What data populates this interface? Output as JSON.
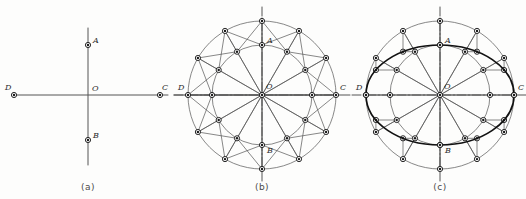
{
  "figure": {
    "background_color": "#fdfdfc",
    "line_color": "#555555",
    "bold_line_color": "#111111",
    "marker_fill": "#1a1a1a",
    "marker_ring": "#ffffff",
    "label_color": "#2b2b2b"
  },
  "panels": [
    {
      "id": "a",
      "caption": "(a)",
      "caption_x": 88,
      "caption_y": 188,
      "description": "Major and minor axes only",
      "center": {
        "x": 88,
        "y": 95,
        "label": "O"
      },
      "points": [
        {
          "label": "A",
          "x": 88,
          "y": 45,
          "label_dx": 5,
          "label_dy": -2
        },
        {
          "label": "B",
          "x": 88,
          "y": 140,
          "label_dx": 5,
          "label_dy": -2
        },
        {
          "label": "C",
          "x": 160,
          "y": 95,
          "label_dx": 2,
          "label_dy": -5
        },
        {
          "label": "D",
          "x": 14,
          "y": 95,
          "label_dx": -9,
          "label_dy": -5
        }
      ],
      "axis_horizontal": {
        "x1": 14,
        "y1": 95,
        "x2": 168,
        "y2": 95
      },
      "axis_vertical": {
        "x1": 88,
        "y1": 28,
        "x2": 88,
        "y2": 165
      }
    },
    {
      "id": "b",
      "caption": "(b)",
      "caption_x": 262,
      "caption_y": 188,
      "description": "Two concentric circles divided by twelve radial lines",
      "center": {
        "x": 262,
        "y": 95,
        "label": "O"
      },
      "outer_radius": 74,
      "inner_radius": 50,
      "divisions": 12,
      "angles_deg": [
        0,
        30,
        60,
        90,
        120,
        150,
        180,
        210,
        240,
        270,
        300,
        330
      ],
      "chord_links": true,
      "points": [
        {
          "label": "A",
          "x": 262,
          "y": 45,
          "label_dx": 5,
          "label_dy": -2
        },
        {
          "label": "B",
          "x": 262,
          "y": 145,
          "label_dx": 5,
          "label_dy": 8
        },
        {
          "label": "C",
          "x": 336,
          "y": 95,
          "label_dx": 4,
          "label_dy": -5
        },
        {
          "label": "D",
          "x": 188,
          "y": 95,
          "label_dx": -10,
          "label_dy": -5
        }
      ]
    },
    {
      "id": "c",
      "caption": "(c)",
      "caption_x": 440,
      "caption_y": 188,
      "description": "Ellipse traced through construction points",
      "center": {
        "x": 440,
        "y": 95,
        "label": "O"
      },
      "outer_radius": 74,
      "inner_radius": 50,
      "divisions": 12,
      "ellipse_semi_major": 74,
      "ellipse_semi_minor": 50,
      "show_projection_lines": true,
      "points": [
        {
          "label": "A",
          "x": 440,
          "y": 45,
          "label_dx": 5,
          "label_dy": -2
        },
        {
          "label": "B",
          "x": 440,
          "y": 145,
          "label_dx": 5,
          "label_dy": 8
        },
        {
          "label": "C",
          "x": 514,
          "y": 95,
          "label_dx": 4,
          "label_dy": -5
        },
        {
          "label": "D",
          "x": 366,
          "y": 95,
          "label_dx": -10,
          "label_dy": -5
        }
      ]
    }
  ],
  "geometry": {
    "marker_outer_radius": 2.6,
    "marker_inner_radius": 1.2,
    "thin_stroke_width": 0.7,
    "bold_stroke_width": 1.7,
    "axis_stroke_width": 1.0
  }
}
